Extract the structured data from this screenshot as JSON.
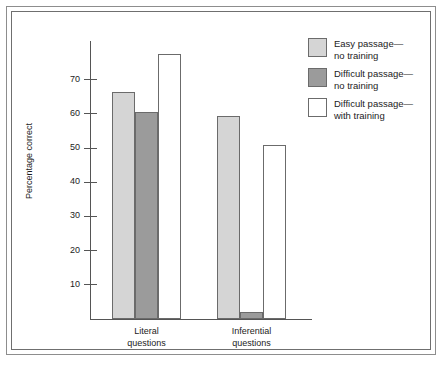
{
  "figure": {
    "caption_partial": ""
  },
  "chart_data": {
    "type": "bar",
    "title": "",
    "xlabel": "",
    "ylabel": "Percentage correct",
    "ylim": [
      0,
      80
    ],
    "yticks": [
      10,
      20,
      30,
      40,
      50,
      60,
      70
    ],
    "ytick_labels": [
      "10",
      "20",
      "30",
      "40",
      "50",
      "60",
      "70"
    ],
    "grid": false,
    "legend_position": "right",
    "categories": [
      "Literal questions",
      "Inferential questions"
    ],
    "category_lines": [
      [
        "Literal",
        "questions"
      ],
      [
        "Inferential",
        "questions"
      ]
    ],
    "series": [
      {
        "name": "Easy passage—\nno training",
        "color": "#d5d5d5",
        "values": [
          66.5,
          59.5
        ]
      },
      {
        "name": "Difficult passage—\nno training",
        "color": "#9b9b9b",
        "values": [
          60.5,
          2.0
        ]
      },
      {
        "name": "Difficult passage—\nwith training",
        "color": "#ffffff",
        "values": [
          77.5,
          51.0
        ]
      }
    ]
  },
  "legend": {
    "items": [
      {
        "label": "Easy passage—\nno training",
        "color": "#d5d5d5"
      },
      {
        "label": "Difficult passage—\nno training",
        "color": "#9b9b9b"
      },
      {
        "label": "Difficult passage—\nwith training",
        "color": "#ffffff"
      }
    ]
  },
  "colors": {
    "axis": "#555555",
    "bar_outline": "#6b6b6b",
    "frame_outer": "#8d8d8d",
    "frame_inner": "#6f6f6f",
    "text": "#1c1c1c"
  }
}
